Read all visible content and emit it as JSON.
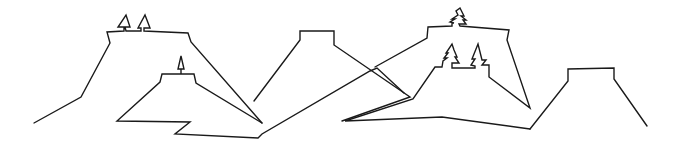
{
  "scene": {
    "description": "Line drawing of mesa / plateau landscape with small tree outlines",
    "stroke_color": "#1a1a1a",
    "background": "#ffffff",
    "shapes": [
      {
        "name": "left-mesa",
        "points": "34,123 81,97 110,43 107,32 124,31 124,27 118,27 126,15 130,27 125,27 126,31 141,31 141,28 138,28 145,15 150,28 144,28 144,31 188,33 191,42 262,123"
      },
      {
        "name": "small-front-mesa",
        "points": "262,123 196,83 194,74 181,74 181,69 178,69 181,56 184,69 181,69 181,74 162,74 160,82 117,121 190,122 175,134 258,138 262,134 370,71 377,68 404,93"
      },
      {
        "name": "center-mesa",
        "points": "254,101 300,40 300,31 334,31 334,45 410,97 342,121"
      },
      {
        "name": "right-mesa",
        "points": "375,67 427,38 428,27 452,26 452,23 454,23 450,22 455,19 452,19 458,15 456,11 460,8 464,16 461,16 466,20 463,20 466,24 459,24 460,26 509,30 507,40 530,108 489,77 489,65 482,65 486,60 482,60 478,44 472,59 475,59 471,65 475,66 475,68 452,68 452,63 459,63 455,57 457,57 454,50 452,44 446,53 448,53 444,58 447,58 443,61 442,67 435,67 413,99 345,121 442,117 530,129"
      },
      {
        "name": "far-right-mesa",
        "points": "530,129 568,81 568,69 614,68 614,79 647,126"
      }
    ]
  }
}
